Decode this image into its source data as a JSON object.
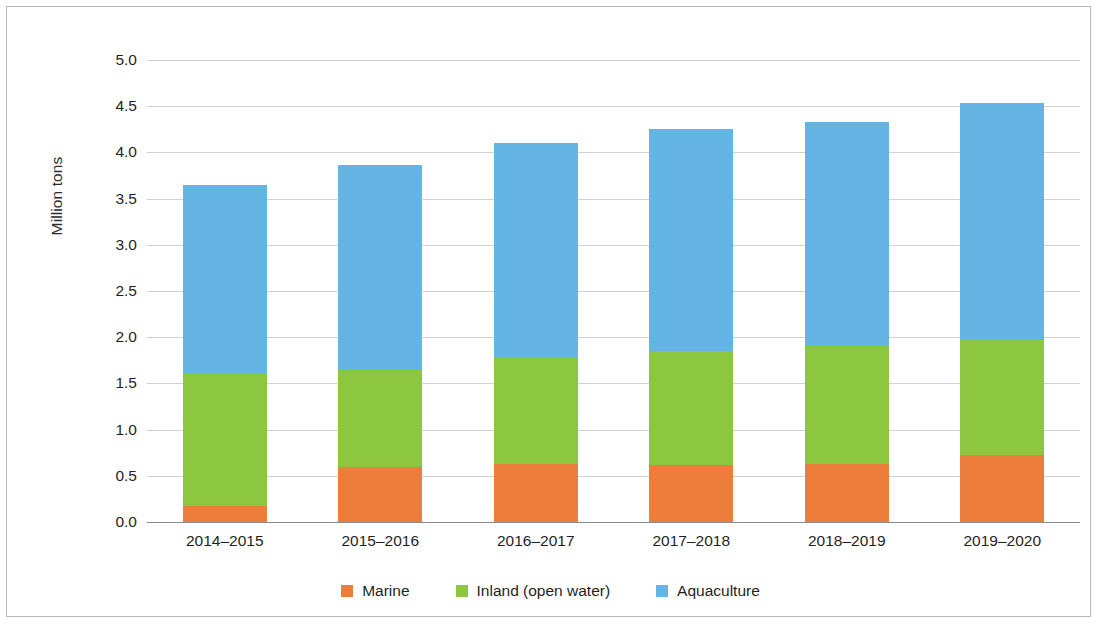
{
  "chart_data": {
    "type": "bar",
    "subtype": "stacked-bar",
    "title": "",
    "xlabel": "",
    "ylabel": "Million tons",
    "ylim": [
      0.0,
      5.0
    ],
    "ytick_labels": [
      "0.0",
      "0.5",
      "1.0",
      "1.5",
      "2.0",
      "2.5",
      "3.0",
      "3.5",
      "4.0",
      "4.5",
      "5.0"
    ],
    "ytick_values": [
      0.0,
      0.5,
      1.0,
      1.5,
      2.0,
      2.5,
      3.0,
      3.5,
      4.0,
      4.5,
      5.0
    ],
    "grid": true,
    "legend_position": "bottom",
    "categories": [
      "2014–2015",
      "2015–2016",
      "2016–2017",
      "2017–2018",
      "2018–2019",
      "2019–2020"
    ],
    "series": [
      {
        "name": "Marine",
        "color": "#ED7D3A",
        "values": [
          0.17,
          0.6,
          0.63,
          0.62,
          0.63,
          0.73
        ]
      },
      {
        "name": "Inland (open water)",
        "color": "#8DC63F",
        "values": [
          1.43,
          1.05,
          1.15,
          1.23,
          1.27,
          1.24
        ]
      },
      {
        "name": "Aquaculture",
        "color": "#64B4E4",
        "values": [
          2.05,
          2.21,
          2.32,
          2.4,
          2.43,
          2.57
        ]
      }
    ],
    "totals": [
      3.65,
      3.86,
      4.1,
      4.25,
      4.33,
      4.54
    ]
  },
  "legend": {
    "entries": [
      {
        "label": "Marine",
        "color": "#ED7D3A"
      },
      {
        "label": "Inland (open water)",
        "color": "#8DC63F"
      },
      {
        "label": "Aquaculture",
        "color": "#64B4E4"
      }
    ]
  },
  "style": {
    "background": "#ffffff",
    "frame_color": "#b9b9b9",
    "gridline_color": "#d2d2d2",
    "baseline_color": "#8a8a8a",
    "text_color": "#1f1f1f"
  }
}
